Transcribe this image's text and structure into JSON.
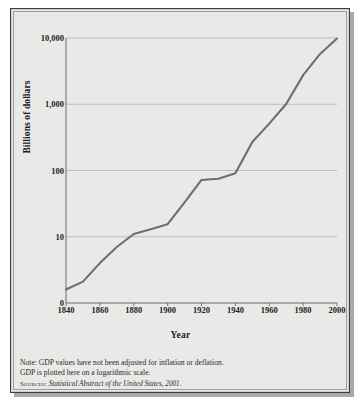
{
  "figure": {
    "background_color": "#e9e9e7",
    "border_color": "#3d3d3d",
    "line_color": "#6e6e6e",
    "grid_color": "#b8b8b6",
    "axis_color": "#6b6b69"
  },
  "notes": {
    "line1": "Note: GDP values have not been adjusted for inflation or deflation.",
    "line2": "GDP is plotted here on a logarithmic scale.",
    "source_prefix": "Sources:",
    "source_title": "Statistical Abstract of the United States, 2001."
  },
  "chart_data": {
    "type": "line",
    "title": "",
    "xlabel": "Year",
    "ylabel": "Billions of dollars",
    "scale": "log",
    "grid": true,
    "legend": "none",
    "xlim": [
      1840,
      2000
    ],
    "ylim": [
      1,
      10000
    ],
    "xticks": [
      1840,
      1860,
      1880,
      1900,
      1920,
      1940,
      1960,
      1980,
      2000
    ],
    "xtick_labels": [
      "1840",
      "1860",
      "1880",
      "1900",
      "1920",
      "1940",
      "1960",
      "1980",
      "2000"
    ],
    "yticks": [
      10000,
      1000,
      100,
      10
    ],
    "ytick_labels": [
      "10,000",
      "1,000",
      "100",
      "10"
    ],
    "y_origin_label": "0",
    "x": [
      1840,
      1850,
      1860,
      1870,
      1880,
      1890,
      1900,
      1910,
      1920,
      1930,
      1940,
      1950,
      1960,
      1970,
      1980,
      1990,
      2000
    ],
    "values": [
      1.6,
      2.1,
      4.0,
      7.0,
      11.0,
      13.0,
      15.5,
      33.0,
      72.0,
      75.0,
      91.0,
      270.0,
      510.0,
      1010.0,
      2750.0,
      5750.0,
      9800.0
    ],
    "series_name": "GDP"
  }
}
